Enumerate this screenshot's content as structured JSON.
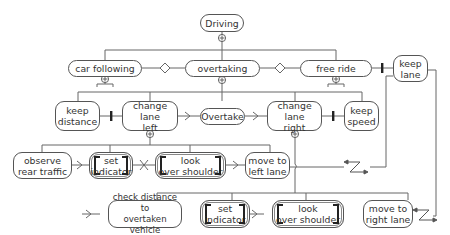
{
  "diagram": {
    "title": "Driving",
    "colors": {
      "line": "#666666",
      "border": "#555555",
      "text": "#333333",
      "bar": "#222222"
    },
    "level1": {
      "car_following": "car following",
      "overtaking": "overtaking",
      "free_ride": "free ride",
      "keep_lane": "keep\nlane"
    },
    "level2": {
      "keep_distance": "keep\ndistance",
      "change_lane_left": "change lane\nleft",
      "overtake": "Overtake",
      "change_lane_right": "change lane\nright",
      "keep_speed": "keep\nspeed"
    },
    "left_sequence": {
      "observe_rear_traffic": "observe\nrear traffic",
      "set_indicator": "set\nindicator",
      "look_over_shoulder": "look\nover shoulder",
      "move_to_left_lane": "move to\nleft lane"
    },
    "right_sequence": {
      "check_distance": "check distance to\novertaken vehicle",
      "set_indicator": "set\nindicator",
      "look_over_shoulder": "look\nover shoulder",
      "move_to_right_lane": "move to\nright lane"
    },
    "symbols": {
      "decomposition": "circle-plus",
      "alternative": "diamond",
      "disable": "bar",
      "enable": "chevron-arrow",
      "order_independence": "x-cross",
      "interruption": "zigzag-arrow"
    }
  }
}
